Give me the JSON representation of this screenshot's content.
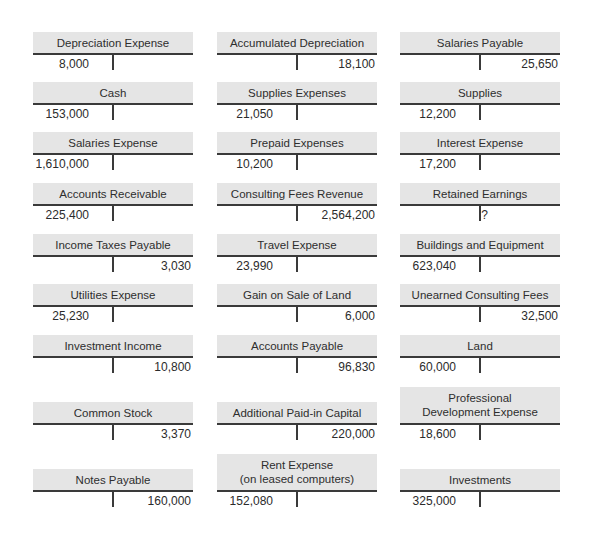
{
  "accounts": [
    {
      "name": "Depreciation Expense",
      "debit": "8,000",
      "credit": ""
    },
    {
      "name": "Accumulated Depreciation",
      "debit": "",
      "credit": "18,100"
    },
    {
      "name": "Salaries Payable",
      "debit": "",
      "credit": "25,650"
    },
    {
      "name": "Cash",
      "debit": "153,000",
      "credit": ""
    },
    {
      "name": "Supplies Expenses",
      "debit": "21,050",
      "credit": ""
    },
    {
      "name": "Supplies",
      "debit": "12,200",
      "credit": ""
    },
    {
      "name": "Salaries Expense",
      "debit": "1,610,000",
      "credit": ""
    },
    {
      "name": "Prepaid Expenses",
      "debit": "10,200",
      "credit": ""
    },
    {
      "name": "Interest Expense",
      "debit": "17,200",
      "credit": ""
    },
    {
      "name": "Accounts Receivable",
      "debit": "225,400",
      "credit": ""
    },
    {
      "name": "Consulting Fees Revenue",
      "debit": "",
      "credit": "2,564,200"
    },
    {
      "name": "Retained Earnings",
      "debit": "",
      "credit": "?"
    },
    {
      "name": "Income Taxes Payable",
      "debit": "",
      "credit": "3,030"
    },
    {
      "name": "Travel Expense",
      "debit": "23,990",
      "credit": ""
    },
    {
      "name": "Buildings and Equipment",
      "debit": "623,040",
      "credit": ""
    },
    {
      "name": "Utilities Expense",
      "debit": "25,230",
      "credit": ""
    },
    {
      "name": "Gain on Sale of Land",
      "debit": "",
      "credit": "6,000"
    },
    {
      "name": "Unearned Consulting Fees",
      "debit": "",
      "credit": "32,500"
    },
    {
      "name": "Investment Income",
      "debit": "",
      "credit": "10,800"
    },
    {
      "name": "Accounts Payable",
      "debit": "",
      "credit": "96,830"
    },
    {
      "name": "Land",
      "debit": "60,000",
      "credit": ""
    },
    {
      "name": "Common Stock",
      "debit": "",
      "credit": "3,370"
    },
    {
      "name": "Additional Paid-in Capital",
      "debit": "",
      "credit": "220,000"
    },
    {
      "name_line1": "Professional",
      "name_line2": "Development Expense",
      "debit": "18,600",
      "credit": ""
    },
    {
      "name": "Notes Payable",
      "debit": "",
      "credit": "160,000"
    },
    {
      "name_line1": "Rent Expense",
      "name_line2": "(on leased computers)",
      "debit": "152,080",
      "credit": ""
    },
    {
      "name": "Investments",
      "debit": "325,000",
      "credit": ""
    }
  ]
}
